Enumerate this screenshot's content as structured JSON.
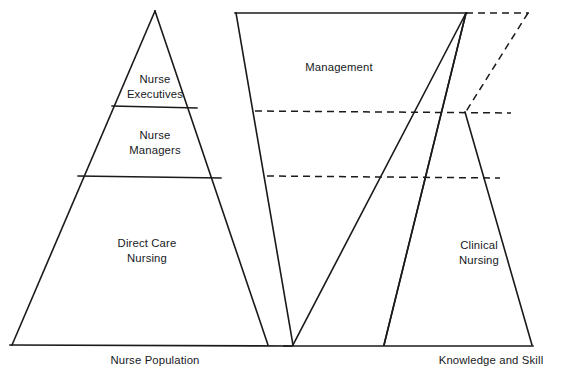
{
  "figure": {
    "background_color": "#ffffff",
    "line_color": "#1a1a1a",
    "left_pyramid": {
      "name": "nurse-population-pyramid",
      "axis_label": "Nurse Population",
      "tiers": [
        {
          "key": "top",
          "label": "Nurse\nExecutives"
        },
        {
          "key": "middle",
          "label": "Nurse\nManagers"
        },
        {
          "key": "base",
          "label": "Direct Care\nNursing"
        }
      ]
    },
    "right_diagram": {
      "name": "knowledge-and-skill-diagram",
      "axis_label": "Knowledge and Skill",
      "regions": [
        {
          "key": "management",
          "label": "Management"
        },
        {
          "key": "clinical",
          "label": "Clinical\nNursing"
        }
      ]
    }
  }
}
